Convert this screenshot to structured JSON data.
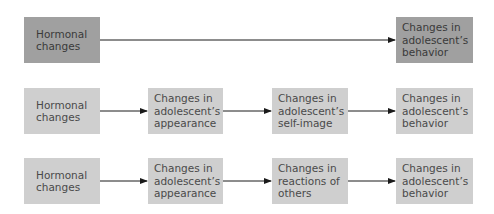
{
  "colors": {
    "emphasis_box": "#a0a0a0",
    "step_box": "#cfcfcf",
    "arrow": "#1a1a1a",
    "text": "#4a4a4a"
  },
  "rows": [
    {
      "name": "direct-model",
      "boxes": [
        {
          "label": "Hormonal\nchanges"
        },
        {
          "label": "Changes in\nadolescent’s\nbehavior"
        }
      ]
    },
    {
      "name": "self-image-model",
      "boxes": [
        {
          "label": "Hormonal\nchanges"
        },
        {
          "label": "Changes in\nadolescent’s\nappearance"
        },
        {
          "label": "Changes in\nadolescent’s\nself-image"
        },
        {
          "label": "Changes in\nadolescent’s\nbehavior"
        }
      ]
    },
    {
      "name": "reactions-model",
      "boxes": [
        {
          "label": "Hormonal\nchanges"
        },
        {
          "label": "Changes in\nadolescent’s\nappearance"
        },
        {
          "label": "Changes in\nreactions of\nothers"
        },
        {
          "label": "Changes in\nadolescent’s\nbehavior"
        }
      ]
    }
  ]
}
